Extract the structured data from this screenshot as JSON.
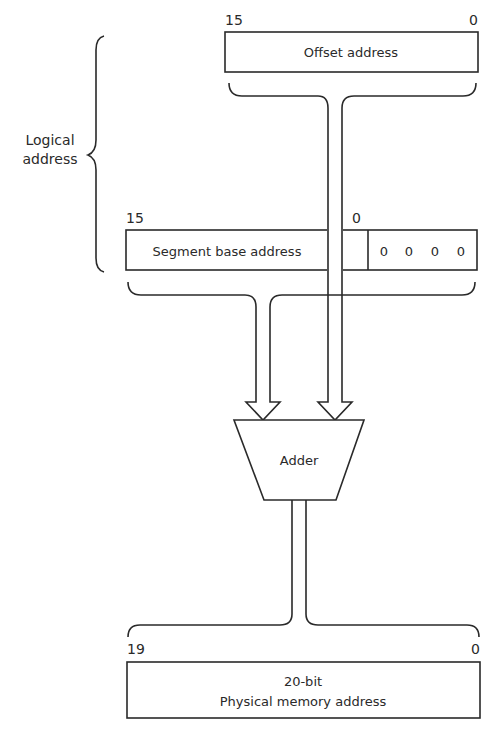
{
  "logical_address": {
    "label_line1": "Logical",
    "label_line2": "address"
  },
  "offset_register": {
    "label": "Offset address",
    "msb": "15",
    "lsb": "0"
  },
  "segment_register": {
    "label": "Segment base address",
    "msb": "15",
    "lsb": "0",
    "appended_zeros": [
      "0",
      "0",
      "0",
      "0"
    ]
  },
  "adder": {
    "label": "Adder"
  },
  "physical_address": {
    "label_line1": "20-bit",
    "label_line2": "Physical memory address",
    "msb": "19",
    "lsb": "0"
  }
}
